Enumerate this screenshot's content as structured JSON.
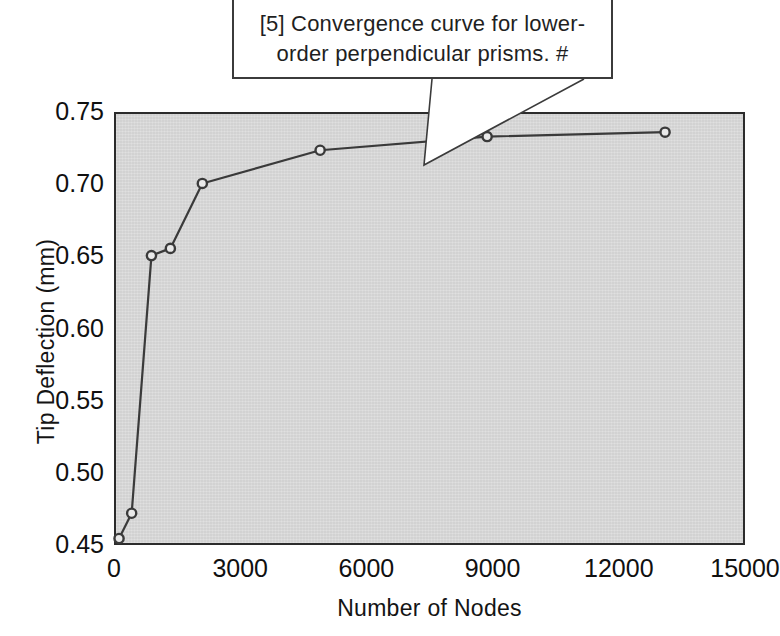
{
  "callout": {
    "text": "[5] Convergence curve for lower-\norder perpendicular prisms.  #",
    "border_color": "#3b3b3b",
    "background": "#ffffff"
  },
  "chart_data": {
    "type": "line",
    "title": "",
    "xlabel": "Number of Nodes",
    "ylabel": "Tip Deflection (mm)",
    "xlim": [
      0,
      15000
    ],
    "ylim": [
      0.45,
      0.75
    ],
    "xticks": [
      0,
      3000,
      6000,
      9000,
      12000,
      15000
    ],
    "xtick_labels": [
      "0",
      "3000",
      "6000",
      "9000",
      "12000",
      "15000"
    ],
    "yticks": [
      0.45,
      0.5,
      0.55,
      0.6,
      0.65,
      0.7,
      0.75
    ],
    "ytick_labels": [
      "0.45",
      "0.50",
      "0.55",
      "0.60",
      "0.65",
      "0.70",
      "0.75"
    ],
    "grid": false,
    "legend": null,
    "plot_background": "#d6d6d6",
    "line_color": "#3a3a3a",
    "marker": "circle-open",
    "series": [
      {
        "name": "Tip deflection vs number of nodes",
        "x": [
          120,
          420,
          890,
          1340,
          2100,
          4900,
          8870,
          13100
        ],
        "y": [
          0.4545,
          0.472,
          0.6505,
          0.6555,
          0.7005,
          0.7235,
          0.733,
          0.736
        ]
      }
    ]
  }
}
